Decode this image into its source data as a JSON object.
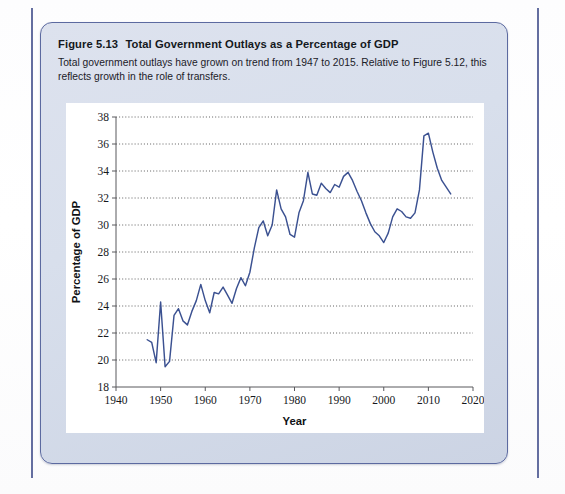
{
  "page": {
    "rule_color": "#49558f",
    "box_border_color": "#5c6aa0",
    "box_fill_color": "#d8dfec"
  },
  "figure": {
    "number_label": "Figure 5.13",
    "title": "Total Government Outlays as a Percentage of GDP",
    "caption": "Total government outlays have grown on trend from 1947 to 2015. Relative to Figure 5.12, this reflects growth in the role of transfers."
  },
  "chart_data": {
    "type": "line",
    "title": "Total Government Outlays as a Percentage of GDP",
    "xlabel": "Year",
    "ylabel": "Percentage of GDP",
    "xlim": [
      1940,
      2020
    ],
    "ylim": [
      18,
      38
    ],
    "xticks": [
      1940,
      1950,
      1960,
      1970,
      1980,
      1990,
      2000,
      2010,
      2020
    ],
    "yticks": [
      18,
      20,
      22,
      24,
      26,
      28,
      30,
      32,
      34,
      36,
      38
    ],
    "grid": "horizontal-dotted",
    "legend": "none",
    "line_color": "#3b5191",
    "series": [
      {
        "name": "Total government outlays (% of GDP)",
        "x": [
          1947,
          1948,
          1949,
          1950,
          1951,
          1952,
          1953,
          1954,
          1955,
          1956,
          1957,
          1958,
          1959,
          1960,
          1961,
          1962,
          1963,
          1964,
          1965,
          1966,
          1967,
          1968,
          1969,
          1970,
          1971,
          1972,
          1973,
          1974,
          1975,
          1976,
          1977,
          1978,
          1979,
          1980,
          1981,
          1982,
          1983,
          1984,
          1985,
          1986,
          1987,
          1988,
          1989,
          1990,
          1991,
          1992,
          1993,
          1994,
          1995,
          1996,
          1997,
          1998,
          1999,
          2000,
          2001,
          2002,
          2003,
          2004,
          2005,
          2006,
          2007,
          2008,
          2009,
          2010,
          2011,
          2012,
          2013,
          2014,
          2015
        ],
        "values": [
          21.5,
          21.3,
          19.8,
          24.3,
          19.5,
          19.9,
          23.3,
          23.8,
          22.9,
          22.6,
          23.6,
          24.4,
          25.6,
          24.4,
          23.5,
          25.0,
          24.9,
          25.4,
          24.8,
          24.2,
          25.3,
          26.1,
          25.5,
          26.5,
          28.3,
          29.8,
          30.3,
          29.2,
          30.0,
          32.6,
          31.2,
          30.6,
          29.3,
          29.1,
          30.9,
          31.8,
          33.9,
          32.3,
          32.2,
          33.1,
          32.7,
          32.4,
          33.0,
          32.8,
          33.6,
          33.9,
          33.3,
          32.5,
          31.8,
          30.9,
          30.1,
          29.5,
          29.2,
          28.7,
          29.4,
          30.6,
          31.2,
          31.0,
          30.6,
          30.5,
          30.9,
          32.6,
          36.6,
          36.8,
          35.4,
          34.2,
          33.3,
          32.8,
          32.3
        ]
      }
    ]
  }
}
